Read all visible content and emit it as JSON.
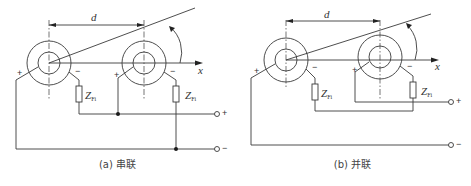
{
  "panels": [
    {
      "id": "a",
      "caption": "(a) 串联",
      "dimension_label": "d",
      "axis_label": "x",
      "impedance_left": {
        "main": "Z",
        "sub": "Fi"
      },
      "impedance_right": {
        "main": "Z",
        "sub": "Fi"
      },
      "coil_left_plus": "+",
      "coil_left_minus": "−",
      "coil_right_plus": "+",
      "coil_right_minus": "−",
      "terminal_top": "+",
      "terminal_bottom": "−",
      "connection": "series"
    },
    {
      "id": "b",
      "caption": "(b) 并联",
      "dimension_label": "d",
      "axis_label": "x",
      "impedance_left": {
        "main": "Z",
        "sub": "Fi"
      },
      "impedance_right": {
        "main": "Z",
        "sub": "Fi"
      },
      "coil_left_plus": "+",
      "coil_left_minus": "−",
      "coil_right_plus": "+",
      "coil_right_minus": "−",
      "terminal_top": "+",
      "terminal_bottom": "−",
      "connection": "parallel"
    }
  ],
  "colors": {
    "line": "#3a3a3a",
    "background": "#ffffff"
  }
}
